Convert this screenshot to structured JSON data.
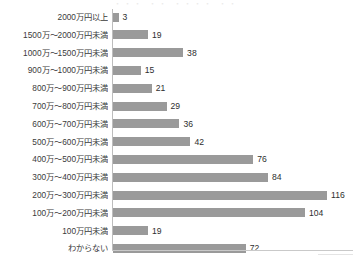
{
  "chart_data": {
    "type": "bar",
    "orientation": "horizontal",
    "title": "",
    "xlabel": "",
    "ylabel": "",
    "grid": false,
    "legend": null,
    "axis_tick_labels": [],
    "xlim": [
      0,
      130
    ],
    "categories": [
      "2000万円以上",
      "1500万〜2000万円未満",
      "1000万〜1500万円未満",
      "900万〜1000万円未満",
      "800万〜900万円未満",
      "700万〜800万円未満",
      "600万〜700万円未満",
      "500万〜600万円未満",
      "400万〜500万円未満",
      "300万〜400万円未満",
      "200万〜300万円未満",
      "100万〜200万円未満",
      "100万円未満",
      "わからない"
    ],
    "values": [
      3,
      19,
      38,
      15,
      21,
      29,
      36,
      42,
      76,
      84,
      116,
      104,
      19,
      72
    ],
    "bar_color": "#9a9a9a",
    "axis_color": "#bdbdbd",
    "label_color": "#3b3b3b",
    "value_color": "#2e2e2e"
  },
  "top_remnant": "・・・ ・・ ・・・・ ・・"
}
